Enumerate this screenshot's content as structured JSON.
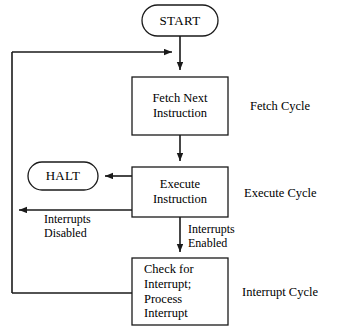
{
  "diagram": {
    "stroke_color": "#1a1a1a",
    "fill_color": "#ffffff",
    "background": "#ffffff"
  },
  "nodes": {
    "start": {
      "label": "START",
      "shape": "rounded-terminal"
    },
    "fetch": {
      "label": "Fetch Next\nInstruction",
      "shape": "rectangle"
    },
    "halt": {
      "label": "HALT",
      "shape": "rounded-terminal"
    },
    "execute": {
      "label": "Execute\nInstruction",
      "shape": "rectangle"
    },
    "interrupt": {
      "label": "Check for\nInterrupt;\nProcess\nInterrupt",
      "shape": "rectangle"
    }
  },
  "cycle_labels": {
    "fetch": "Fetch Cycle",
    "execute": "Execute Cycle",
    "interrupt": "Interrupt Cycle"
  },
  "edge_labels": {
    "interrupts_disabled": "Interrupts\nDisabled",
    "interrupts_enabled": "Interrupts\nEnabled"
  }
}
